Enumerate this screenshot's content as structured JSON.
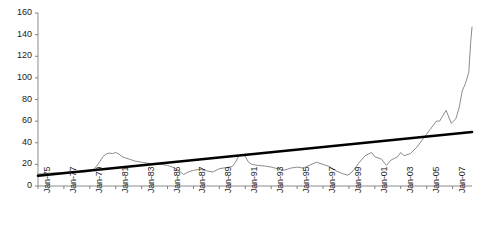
{
  "chart_data": {
    "type": "line",
    "title": "",
    "subtitle": "",
    "xlabel": "",
    "ylabel": "",
    "ylim": [
      0,
      160
    ],
    "yticks": [
      0,
      20,
      40,
      60,
      80,
      100,
      120,
      140,
      160
    ],
    "grid": false,
    "legend": "none",
    "axis_color": "#808080",
    "x_tick_labels": [
      "Jan-75",
      "Jan-77",
      "Jan-79",
      "Jan-81",
      "Jan-83",
      "Jan-85",
      "Jan-87",
      "Jan-89",
      "Jan-91",
      "Jan-93",
      "Jan-95",
      "Jan-97",
      "Jan-99",
      "Jan-01",
      "Jan-03",
      "Jan-05",
      "Jan-07"
    ],
    "x_start": "Jan-75",
    "x_end": "Jan-08",
    "series": [
      {
        "name": "series-line",
        "color": "#7f7f7f",
        "width": 0.9,
        "x": [
          1975.0,
          1975.5,
          1976.0,
          1976.5,
          1977.0,
          1977.5,
          1978.0,
          1978.5,
          1979.0,
          1979.25,
          1979.5,
          1979.75,
          1980.0,
          1980.25,
          1980.5,
          1980.75,
          1981.0,
          1981.25,
          1981.5,
          1982.0,
          1982.5,
          1983.0,
          1983.5,
          1984.0,
          1984.5,
          1985.0,
          1985.5,
          1986.0,
          1986.25,
          1986.5,
          1987.0,
          1987.5,
          1988.0,
          1988.5,
          1989.0,
          1989.5,
          1990.0,
          1990.25,
          1990.5,
          1990.75,
          1991.0,
          1991.25,
          1991.5,
          1992.0,
          1992.5,
          1993.0,
          1993.5,
          1994.0,
          1994.5,
          1995.0,
          1995.5,
          1996.0,
          1996.5,
          1997.0,
          1997.5,
          1998.0,
          1998.5,
          1998.9,
          1999.25,
          1999.75,
          2000.25,
          2000.75,
          2001.0,
          2001.5,
          2001.9,
          2002.25,
          2002.75,
          2003.0,
          2003.25,
          2003.75,
          2004.25,
          2004.75,
          2005.25,
          2005.75,
          2006.0,
          2006.5,
          2006.9,
          2007.25,
          2007.5,
          2007.75,
          2008.0,
          2008.25,
          2008.4,
          2008.5
        ],
        "values": [
          11.0,
          11.5,
          12.0,
          12.2,
          12.5,
          12.7,
          12.9,
          13.0,
          13.5,
          15.0,
          18.0,
          22.0,
          27.0,
          29.5,
          30.5,
          30.0,
          31.0,
          29.5,
          27.0,
          25.0,
          23.0,
          22.0,
          21.0,
          20.5,
          20.0,
          19.0,
          17.0,
          13.0,
          10.5,
          12.5,
          14.5,
          15.5,
          14.0,
          13.0,
          16.0,
          17.0,
          18.0,
          22.0,
          28.0,
          29.0,
          27.5,
          22.0,
          20.0,
          19.0,
          18.5,
          17.5,
          16.0,
          14.5,
          16.5,
          17.5,
          16.5,
          19.5,
          22.0,
          20.0,
          18.0,
          14.0,
          11.5,
          10.0,
          13.0,
          21.0,
          28.0,
          31.0,
          27.0,
          25.0,
          19.0,
          24.0,
          27.0,
          31.0,
          28.0,
          30.0,
          36.0,
          44.0,
          52.0,
          60.0,
          60.0,
          70.0,
          58.0,
          62.0,
          72.0,
          88.0,
          95.0,
          105.0,
          133.0,
          147.0
        ]
      },
      {
        "name": "trend-line",
        "color": "#000000",
        "width": 2.6,
        "kind": "trend",
        "x": [
          1975.0,
          2008.5
        ],
        "values": [
          9.5,
          50.0
        ]
      }
    ]
  }
}
